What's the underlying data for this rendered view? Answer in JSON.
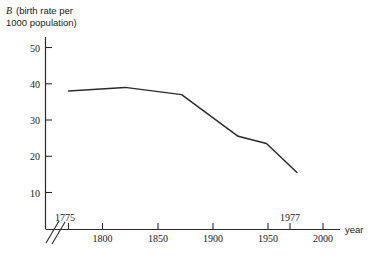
{
  "chart_data": {
    "type": "line",
    "title": "B (birth rate per 1000 population)",
    "title_symbol": "B",
    "title_rest_line1": "(birth rate per",
    "title_line2": "1000 population)",
    "xlabel": "year",
    "ylabel": "B (birth rate per 1000 population)",
    "xlim": [
      1763,
      2012
    ],
    "ylim": [
      0,
      54
    ],
    "grid": false,
    "legend": null,
    "axis_break": true,
    "x_ticks": [
      1775,
      1800,
      1850,
      1900,
      1950,
      1977,
      2000
    ],
    "x_tick_labels": [
      "1775",
      "1800",
      "1850",
      "1900",
      "1950",
      "1977",
      "2000"
    ],
    "y_ticks": [
      10,
      20,
      30,
      40,
      50
    ],
    "y_tick_labels": [
      "10",
      "20",
      "30",
      "40",
      "50"
    ],
    "series": [
      {
        "name": "birth rate",
        "x": [
          1775,
          1825,
          1875,
          1925,
          1950,
          1977
        ],
        "values": [
          38.0,
          39.0,
          37.0,
          25.5,
          23.5,
          15.5
        ],
        "color": "#2b2b2b"
      }
    ]
  },
  "colors": {
    "axis": "#2a2a2a",
    "line": "#2b2b2b",
    "text": "#1a1a1a",
    "background": "#ffffff"
  }
}
